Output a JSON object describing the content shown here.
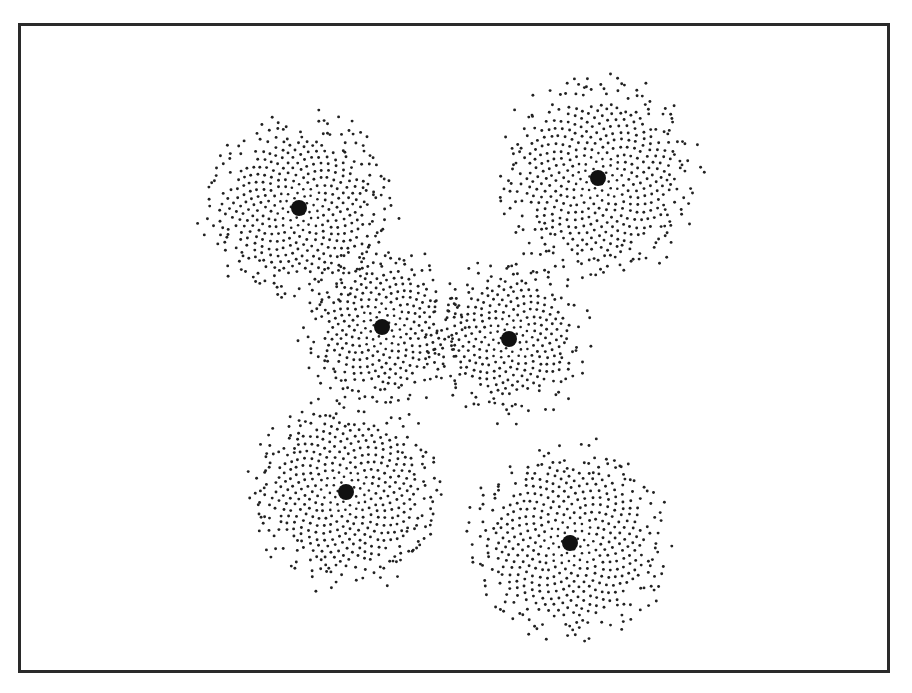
{
  "figure": {
    "frame": {
      "x": 18,
      "y": 23,
      "width": 875,
      "height": 653,
      "stroke": "#2a2a2a"
    },
    "dot_color": "#222222",
    "clusters": [
      {
        "id": "upper-left",
        "cx": 299,
        "cy": 208,
        "core_r": 8,
        "points": 520,
        "spread": 4.0,
        "radius": 90
      },
      {
        "id": "upper-right",
        "cx": 598,
        "cy": 178,
        "core_r": 8,
        "points": 560,
        "spread": 4.1,
        "radius": 98
      },
      {
        "id": "middle-left",
        "cx": 382,
        "cy": 327,
        "core_r": 8,
        "points": 380,
        "spread": 3.9,
        "radius": 75
      },
      {
        "id": "middle-right",
        "cx": 509,
        "cy": 339,
        "core_r": 8,
        "points": 380,
        "spread": 3.9,
        "radius": 75
      },
      {
        "id": "lower-left",
        "cx": 346,
        "cy": 492,
        "core_r": 8,
        "points": 540,
        "spread": 4.0,
        "radius": 95
      },
      {
        "id": "lower-right",
        "cx": 570,
        "cy": 543,
        "core_r": 8,
        "points": 560,
        "spread": 4.1,
        "radius": 100
      }
    ]
  }
}
